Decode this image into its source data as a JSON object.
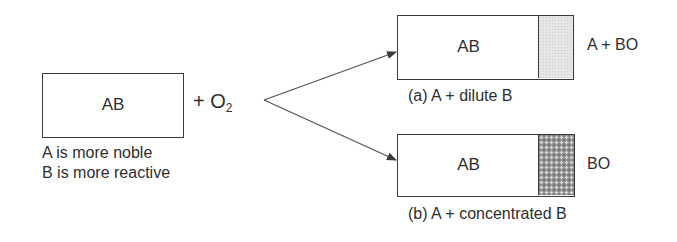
{
  "reactant": {
    "box_label": "AB",
    "plus_oxygen_prefix": "+ O",
    "oxygen_subscript": "2",
    "notes": [
      "A is more noble",
      "B is more reactive"
    ]
  },
  "products": [
    {
      "box_label": "AB",
      "oxide_label": "A + BO",
      "caption": "(a) A + dilute B",
      "oxide_shading": "light"
    },
    {
      "box_label": "AB",
      "oxide_label": "BO",
      "caption": "(b) A + concentrated B",
      "oxide_shading": "dark"
    }
  ],
  "colors": {
    "line": "#3a3a3a",
    "text": "#2e2e2e",
    "oxide_light": "#e6e6e6",
    "oxide_dark": "#9a9a9a"
  }
}
